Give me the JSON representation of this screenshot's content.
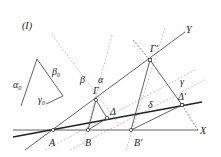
{
  "figure": {
    "label": "(I)",
    "triangle": {
      "side_labels": {
        "alpha": "α",
        "beta": "β",
        "gamma": "γ",
        "sub": "0"
      }
    },
    "axes": {
      "x": "X",
      "y": "Y"
    },
    "points": {
      "A": "A",
      "B": "B",
      "B_prime": "B′",
      "Gamma": "Γ",
      "Gamma_prime": "Γ′",
      "Delta": "Δ",
      "Delta_prime": "Δ′"
    },
    "line_labels": {
      "alpha": "α",
      "beta": "β",
      "gamma": "γ",
      "delta": "δ"
    }
  }
}
